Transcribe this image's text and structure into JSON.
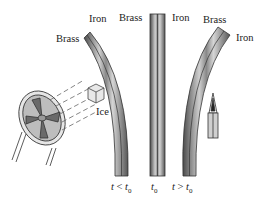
{
  "diagram": {
    "strips": [
      {
        "id": "cold",
        "left_label": "Brass",
        "right_label": "Iron",
        "caption": "t < t0",
        "caption_parts": [
          "t",
          " < ",
          "t",
          "0"
        ]
      },
      {
        "id": "ref",
        "left_label": "Brass",
        "right_label": "Iron",
        "caption": "t0",
        "caption_parts": [
          "t",
          "0"
        ]
      },
      {
        "id": "hot",
        "left_label": "Brass",
        "right_label": "Iron",
        "caption": "t > t0",
        "caption_parts": [
          "t",
          " > ",
          "t",
          "0"
        ]
      }
    ],
    "ice_label": "Ice",
    "icons": [
      "fan-icon",
      "ice-cube-icon",
      "flame-candle-icon"
    ],
    "colors": {
      "strip_dark": "#555555",
      "strip_light": "#d8d8d8",
      "line": "#333333"
    }
  }
}
